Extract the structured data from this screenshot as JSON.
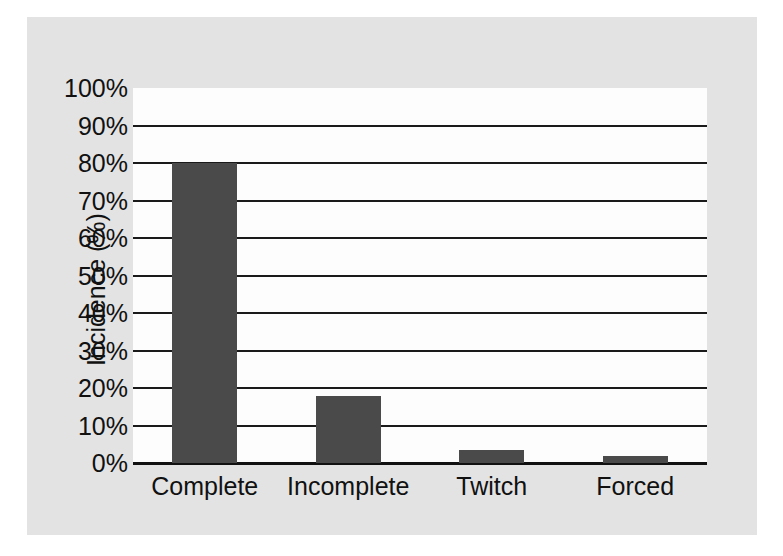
{
  "chart_data": {
    "type": "bar",
    "title": "",
    "xlabel": "",
    "ylabel": "Incidence (%)",
    "categories": [
      "Complete",
      "Incomplete",
      "Twitch",
      "Forced"
    ],
    "values": [
      80,
      17.9,
      3.5,
      2
    ],
    "ylim": [
      0,
      100
    ],
    "ytick_labels": [
      "100%",
      "90%",
      "80%",
      "70%",
      "60%",
      "50%",
      "40%",
      "30%",
      "20%",
      "10%",
      "0%"
    ],
    "ytick_values": [
      100,
      90,
      80,
      70,
      60,
      50,
      40,
      30,
      20,
      10,
      0
    ],
    "grid": "horizontal",
    "legend": "none",
    "colors": {
      "bar_fill": "#4a4a4a",
      "grid_line": "#1a1a1a",
      "axis_line": "#111111",
      "plot_background": "#fdfdfd",
      "figure_background": "#e3e3e3",
      "page_background": "#ffffff",
      "text": "#111111"
    }
  }
}
